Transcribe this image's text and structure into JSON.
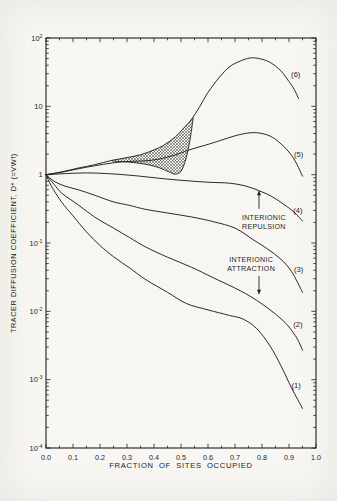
{
  "figure": {
    "paper_color": "#f7f6f2",
    "ink_color": "#1f1f1f"
  },
  "chart_data": {
    "type": "line",
    "title": "",
    "xlabel": "FRACTION OF SITES OCCUPIED",
    "ylabel": "TRACER DIFFUSION COEFFICIENT, D* (=VWf)",
    "grid": false,
    "x_axis": {
      "min": 0.0,
      "max": 1.0,
      "tick_labels": [
        "0.0",
        "0.1",
        "0.2",
        "0.3",
        "0.4",
        "0.5",
        "0.6",
        "0.7",
        "0.8",
        "0.9",
        "1.0"
      ],
      "minor_step": 0.05
    },
    "y_axis": {
      "scale": "log",
      "min": 0.0001,
      "max": 100,
      "ticks": [
        {
          "exp": 2,
          "base": "10",
          "sup": "2"
        },
        {
          "exp": 1,
          "base": "10",
          "sup": ""
        },
        {
          "exp": 0,
          "base": "1",
          "sup": ""
        },
        {
          "exp": -1,
          "base": "10",
          "sup": "-1"
        },
        {
          "exp": -2,
          "base": "10",
          "sup": "-2"
        },
        {
          "exp": -3,
          "base": "10",
          "sup": "-3"
        },
        {
          "exp": -4,
          "base": "10",
          "sup": "-4"
        }
      ]
    },
    "series": [
      {
        "name": "curve-1",
        "label": "(1)",
        "label_at": {
          "x": 0.926,
          "v": 0.00083
        },
        "points": [
          [
            0,
            1
          ],
          [
            0.02,
            0.68
          ],
          [
            0.05,
            0.44
          ],
          [
            0.074,
            0.33
          ],
          [
            0.1,
            0.25
          ],
          [
            0.15,
            0.145
          ],
          [
            0.2,
            0.092
          ],
          [
            0.25,
            0.063
          ],
          [
            0.31,
            0.043
          ],
          [
            0.37,
            0.029
          ],
          [
            0.45,
            0.019
          ],
          [
            0.52,
            0.013
          ],
          [
            0.6,
            0.0105
          ],
          [
            0.68,
            0.0087
          ],
          [
            0.73,
            0.0077
          ],
          [
            0.78,
            0.0056
          ],
          [
            0.83,
            0.0031
          ],
          [
            0.87,
            0.0016
          ],
          [
            0.91,
            0.00075
          ],
          [
            0.95,
            0.00038
          ]
        ]
      },
      {
        "name": "curve-2",
        "label": "(2)",
        "label_at": {
          "x": 0.933,
          "v": 0.0065
        },
        "points": [
          [
            0,
            1
          ],
          [
            0.03,
            0.72
          ],
          [
            0.06,
            0.53
          ],
          [
            0.12,
            0.36
          ],
          [
            0.18,
            0.24
          ],
          [
            0.25,
            0.165
          ],
          [
            0.31,
            0.12
          ],
          [
            0.37,
            0.087
          ],
          [
            0.45,
            0.062
          ],
          [
            0.54,
            0.044
          ],
          [
            0.62,
            0.031
          ],
          [
            0.72,
            0.02
          ],
          [
            0.78,
            0.0145
          ],
          [
            0.83,
            0.0105
          ],
          [
            0.87,
            0.0078
          ],
          [
            0.9,
            0.0059
          ],
          [
            0.93,
            0.004
          ],
          [
            0.95,
            0.0027
          ]
        ]
      },
      {
        "name": "curve-3",
        "label": "(3)",
        "label_at": {
          "x": 0.936,
          "v": 0.041
        },
        "points": [
          [
            0,
            1
          ],
          [
            0.03,
            0.8
          ],
          [
            0.07,
            0.68
          ],
          [
            0.12,
            0.6
          ],
          [
            0.18,
            0.5
          ],
          [
            0.25,
            0.4
          ],
          [
            0.31,
            0.355
          ],
          [
            0.37,
            0.31
          ],
          [
            0.45,
            0.275
          ],
          [
            0.54,
            0.24
          ],
          [
            0.62,
            0.205
          ],
          [
            0.7,
            0.165
          ],
          [
            0.77,
            0.11
          ],
          [
            0.82,
            0.082
          ],
          [
            0.87,
            0.058
          ],
          [
            0.91,
            0.038
          ],
          [
            0.95,
            0.019
          ]
        ]
      },
      {
        "name": "curve-4",
        "label": "(4)",
        "label_at": {
          "x": 0.933,
          "v": 0.3
        },
        "points": [
          [
            0,
            1
          ],
          [
            0.08,
            1.04
          ],
          [
            0.15,
            1.06
          ],
          [
            0.22,
            1.04
          ],
          [
            0.3,
            0.99
          ],
          [
            0.37,
            0.93
          ],
          [
            0.45,
            0.86
          ],
          [
            0.53,
            0.81
          ],
          [
            0.6,
            0.775
          ],
          [
            0.68,
            0.75
          ],
          [
            0.74,
            0.68
          ],
          [
            0.8,
            0.56
          ],
          [
            0.84,
            0.47
          ],
          [
            0.88,
            0.37
          ],
          [
            0.92,
            0.28
          ],
          [
            0.95,
            0.21
          ]
        ]
      },
      {
        "name": "curve-5",
        "label": "(5)",
        "label_at": {
          "x": 0.936,
          "v": 1.95
        },
        "points": [
          [
            0,
            1
          ],
          [
            0.06,
            1.09
          ],
          [
            0.12,
            1.22
          ],
          [
            0.18,
            1.35
          ],
          [
            0.245,
            1.48
          ],
          [
            0.3,
            1.56
          ],
          [
            0.39,
            1.62
          ],
          [
            0.47,
            1.9
          ],
          [
            0.53,
            2.3
          ],
          [
            0.59,
            2.7
          ],
          [
            0.65,
            3.2
          ],
          [
            0.7,
            3.7
          ],
          [
            0.755,
            4.1
          ],
          [
            0.8,
            4.0
          ],
          [
            0.84,
            3.5
          ],
          [
            0.88,
            2.6
          ],
          [
            0.91,
            1.9
          ],
          [
            0.93,
            1.4
          ],
          [
            0.95,
            0.95
          ]
        ]
      },
      {
        "name": "curve-6",
        "label": "(6)",
        "label_at": {
          "x": 0.925,
          "v": 29
        },
        "points": [
          [
            0,
            1
          ],
          [
            0.06,
            1.1
          ],
          [
            0.12,
            1.25
          ],
          [
            0.18,
            1.4
          ],
          [
            0.245,
            1.62
          ],
          [
            0.3,
            1.78
          ],
          [
            0.35,
            1.95
          ],
          [
            0.4,
            2.3
          ],
          [
            0.44,
            2.75
          ],
          [
            0.48,
            3.6
          ],
          [
            0.51,
            4.8
          ],
          [
            0.537,
            6.3
          ],
          [
            0.57,
            10
          ],
          [
            0.6,
            16
          ],
          [
            0.64,
            26
          ],
          [
            0.68,
            38
          ],
          [
            0.72,
            46
          ],
          [
            0.755,
            51
          ],
          [
            0.79,
            50
          ],
          [
            0.83,
            44
          ],
          [
            0.87,
            33
          ],
          [
            0.9,
            23
          ],
          [
            0.92,
            17.5
          ],
          [
            0.935,
            13
          ]
        ]
      }
    ],
    "transition_branch": {
      "comment": "lower boundary of hatched order-disorder transition region",
      "points": [
        [
          0.245,
          1.58
        ],
        [
          0.31,
          1.52
        ],
        [
          0.37,
          1.42
        ],
        [
          0.42,
          1.26
        ],
        [
          0.455,
          1.1
        ],
        [
          0.478,
          1.02
        ],
        [
          0.5,
          1.12
        ],
        [
          0.515,
          1.55
        ],
        [
          0.527,
          2.4
        ],
        [
          0.537,
          4.0
        ],
        [
          0.545,
          6.8
        ]
      ]
    },
    "hatch_region": {
      "points": [
        [
          0.245,
          1.62
        ],
        [
          0.3,
          1.78
        ],
        [
          0.35,
          1.95
        ],
        [
          0.4,
          2.3
        ],
        [
          0.44,
          2.75
        ],
        [
          0.48,
          3.6
        ],
        [
          0.51,
          4.8
        ],
        [
          0.537,
          6.3
        ],
        [
          0.545,
          6.8
        ],
        [
          0.537,
          4.0
        ],
        [
          0.527,
          2.4
        ],
        [
          0.515,
          1.55
        ],
        [
          0.5,
          1.12
        ],
        [
          0.478,
          1.02
        ],
        [
          0.455,
          1.1
        ],
        [
          0.42,
          1.26
        ],
        [
          0.37,
          1.42
        ],
        [
          0.31,
          1.52
        ],
        [
          0.245,
          1.58
        ]
      ]
    },
    "annotations": [
      {
        "id": "interionic-repulsion",
        "lines": [
          "INTERIONIC",
          "REPULSION"
        ],
        "text_at": {
          "x": 0.807,
          "v": 0.206
        },
        "arrow": {
          "dir": "up",
          "x": 0.789,
          "from_v": 0.316,
          "to_v": 0.577
        }
      },
      {
        "id": "interionic-attraction",
        "lines": [
          "INTERIONIC",
          "ATTRACTION"
        ],
        "text_at": {
          "x": 0.76,
          "v": 0.05
        },
        "arrow": {
          "dir": "down",
          "x": 0.789,
          "from_v": 0.033,
          "to_v": 0.018
        }
      }
    ]
  }
}
